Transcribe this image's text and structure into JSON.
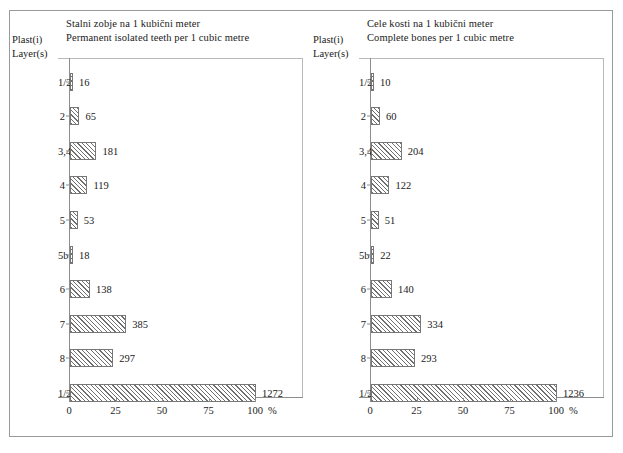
{
  "figure": {
    "panels": [
      {
        "id": "permanent-isolated-teeth",
        "title_sl": "Stalni zobje na 1 kubični meter",
        "title_en": "Permanent isolated teeth per 1 cubic metre",
        "axis_caption_sl": "Plast(i)",
        "axis_caption_en": "Layer(s)",
        "x_unit": "%"
      },
      {
        "id": "complete-bones",
        "title_sl": "Cele kosti na 1 kubični meter",
        "title_en": "Complete bones per 1 cubic metre",
        "axis_caption_sl": "Plast(i)",
        "axis_caption_en": "Layer(s)",
        "x_unit": "%"
      }
    ]
  },
  "chart_data": [
    {
      "type": "bar",
      "orientation": "horizontal",
      "title": "Stalni zobje na 1 kubični meter / Permanent isolated teeth per 1 cubic metre",
      "xlabel": "%",
      "ylabel": "Plast(i) / Layer(s)",
      "categories": [
        "1/2",
        "2",
        "3,4",
        "4",
        "5",
        "5b",
        "6",
        "7",
        "8",
        "1/2 - 8"
      ],
      "values": [
        16,
        65,
        181,
        119,
        53,
        18,
        138,
        385,
        297,
        1272
      ],
      "percent": [
        1.3,
        5.1,
        14.2,
        9.4,
        4.2,
        1.4,
        10.8,
        30.3,
        23.3,
        100
      ],
      "xticks": [
        0,
        25,
        50,
        75,
        100
      ],
      "xticklabels": [
        "0",
        "25",
        "50",
        "75",
        "100"
      ],
      "xlim": [
        0,
        100
      ],
      "grid": false,
      "legend": false
    },
    {
      "type": "bar",
      "orientation": "horizontal",
      "title": "Cele kosti na 1 kubični meter / Complete bones per 1 cubic metre",
      "xlabel": "%",
      "ylabel": "Plast(i) / Layer(s)",
      "categories": [
        "1/2",
        "2",
        "3,4",
        "4",
        "5",
        "5b",
        "6",
        "7",
        "8",
        "1/2 - 8"
      ],
      "values": [
        10,
        60,
        204,
        122,
        51,
        22,
        140,
        334,
        293,
        1236
      ],
      "percent": [
        0.8,
        4.9,
        16.5,
        9.9,
        4.1,
        1.8,
        11.3,
        27.0,
        23.7,
        100
      ],
      "xticks": [
        0,
        25,
        50,
        75,
        100
      ],
      "xticklabels": [
        "0",
        "25",
        "50",
        "75",
        "100"
      ],
      "xlim": [
        0,
        100
      ],
      "grid": false,
      "legend": false
    }
  ]
}
